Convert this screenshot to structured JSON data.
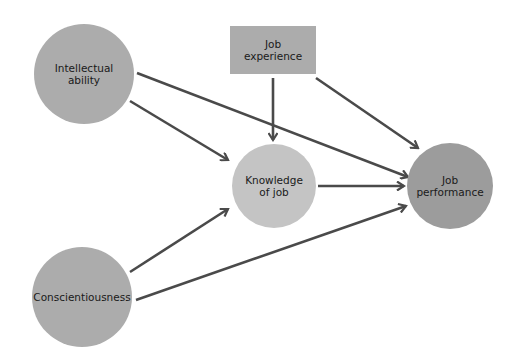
{
  "diagram": {
    "nodes": [
      {
        "id": "intellectual",
        "label": "Intellectual\nability",
        "shape": "circle",
        "cx": 84,
        "cy": 74,
        "r": 50,
        "color": "#acacac"
      },
      {
        "id": "experience",
        "label": "Job\nexperience",
        "shape": "rect",
        "x": 230,
        "y": 26,
        "w": 86,
        "h": 48,
        "color": "#acacac"
      },
      {
        "id": "knowledge",
        "label": "Knowledge\nof job",
        "shape": "circle",
        "cx": 274,
        "cy": 186,
        "r": 42,
        "color": "#c4c4c4"
      },
      {
        "id": "performance",
        "label": "Job\nperformance",
        "shape": "circle",
        "cx": 450,
        "cy": 186,
        "r": 43,
        "color": "#9c9c9c"
      },
      {
        "id": "conscientiousness",
        "label": "Conscientiousness",
        "shape": "circle",
        "cx": 82,
        "cy": 297,
        "r": 50,
        "color": "#acacac"
      }
    ],
    "edges": [
      {
        "from": "intellectual",
        "to": "knowledge",
        "x1": 130,
        "y1": 101,
        "x2": 228,
        "y2": 160
      },
      {
        "from": "intellectual",
        "to": "performance",
        "x1": 137,
        "y1": 73,
        "x2": 408,
        "y2": 177
      },
      {
        "from": "experience",
        "to": "knowledge",
        "x1": 273,
        "y1": 78,
        "x2": 273,
        "y2": 140
      },
      {
        "from": "experience",
        "to": "performance",
        "x1": 316,
        "y1": 78,
        "x2": 418,
        "y2": 148
      },
      {
        "from": "knowledge",
        "to": "performance",
        "x1": 318,
        "y1": 186,
        "x2": 404,
        "y2": 186
      },
      {
        "from": "conscientiousness",
        "to": "knowledge",
        "x1": 130,
        "y1": 272,
        "x2": 228,
        "y2": 209
      },
      {
        "from": "conscientiousness",
        "to": "performance",
        "x1": 136,
        "y1": 300,
        "x2": 406,
        "y2": 206
      }
    ],
    "edge_color": "#4a4a4a"
  }
}
